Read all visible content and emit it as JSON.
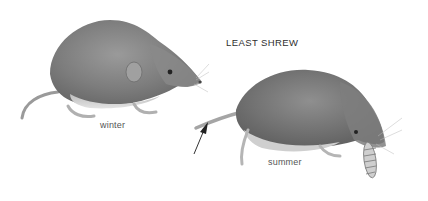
{
  "illustration": {
    "title": "LEAST SHREW",
    "figures": [
      {
        "id": "winter",
        "caption": "winter"
      },
      {
        "id": "summer",
        "caption": "summer"
      }
    ],
    "colors": {
      "background": "#ffffff",
      "fur_dark": "#6e6e6e",
      "fur_mid": "#8f8f8f",
      "fur_light": "#c9c9c9",
      "belly": "#d8d8d8",
      "text": "#3a3a3a"
    }
  }
}
